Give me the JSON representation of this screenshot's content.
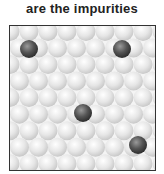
{
  "caption": "are the impurities",
  "diagram": {
    "type": "crystal-lattice-with-impurities",
    "host_atom_color": "#e0e0e0",
    "impurity_color": "#555555",
    "frame_color": "#333333",
    "sphere_diameter_px": 19,
    "impurities": [
      {
        "x": 19,
        "y": 23
      },
      {
        "x": 112,
        "y": 23
      },
      {
        "x": 73,
        "y": 87
      },
      {
        "x": 128,
        "y": 119
      }
    ]
  }
}
